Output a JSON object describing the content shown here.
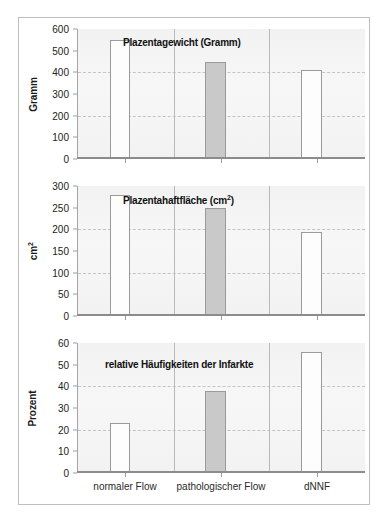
{
  "figure": {
    "categories": [
      "normaler Flow",
      "pathologischer Flow",
      "dNNF"
    ],
    "bar_colors": [
      "#fdfdfd",
      "#c9c9c9",
      "#fdfdfd"
    ],
    "accent_gray": "#c9c9c9",
    "grid_color": "#c4c4c4",
    "axis_color": "#8c8c8c",
    "plot_background": "#f2f2f2"
  },
  "chart_data": [
    {
      "type": "bar",
      "title": "Plazentagewicht (Gramm)",
      "xlabel": "",
      "ylabel": "Gramm",
      "categories": [
        "normaler Flow",
        "pathologischer Flow",
        "dNNF"
      ],
      "values": [
        550,
        450,
        410
      ],
      "ylim": [
        0,
        600
      ],
      "yticks": [
        0,
        100,
        200,
        300,
        400,
        500,
        600
      ],
      "ytick_labels": [
        "0",
        "100",
        "200",
        "300",
        "400",
        "500",
        "600"
      ],
      "gridlines_at": [
        200,
        400
      ],
      "grid": true,
      "legend": "none"
    },
    {
      "type": "bar",
      "title": "Plazentahaftfläche (cm²)",
      "title_base": "Plazentahaftfläche (cm",
      "title_sup": "2",
      "title_tail": ")",
      "xlabel": "",
      "ylabel": "cm²",
      "ylabel_base": "cm",
      "ylabel_sup": "2",
      "categories": [
        "normaler Flow",
        "pathologischer Flow",
        "dNNF"
      ],
      "values": [
        280,
        250,
        195
      ],
      "ylim": [
        0,
        300
      ],
      "yticks": [
        0,
        50,
        100,
        150,
        200,
        250,
        300
      ],
      "ytick_labels": [
        "0",
        "50",
        "100",
        "150",
        "200",
        "250",
        "300"
      ],
      "gridlines_at": [
        100,
        200
      ],
      "grid": true,
      "legend": "none"
    },
    {
      "type": "bar",
      "title": "relative Häufigkeiten der Infarkte",
      "xlabel": "",
      "ylabel": "Prozent",
      "categories": [
        "normaler Flow",
        "pathologischer Flow",
        "dNNF"
      ],
      "values": [
        23,
        38,
        56
      ],
      "ylim": [
        0,
        60
      ],
      "yticks": [
        0,
        10,
        20,
        30,
        40,
        50,
        60
      ],
      "ytick_labels": [
        "0",
        "10",
        "20",
        "30",
        "40",
        "50",
        "60"
      ],
      "gridlines_at": [
        20,
        40
      ],
      "grid": true,
      "legend": "none"
    }
  ]
}
